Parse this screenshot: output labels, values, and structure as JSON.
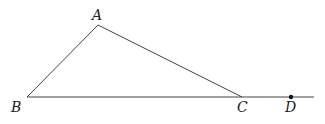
{
  "diagram": {
    "type": "geometry-triangle",
    "points": {
      "A": {
        "label": "A",
        "x": 98,
        "y": 25
      },
      "B": {
        "label": "B",
        "x": 27,
        "y": 97
      },
      "C": {
        "label": "C",
        "x": 242,
        "y": 97
      },
      "D": {
        "label": "D",
        "x": 291,
        "y": 97
      }
    },
    "segments": [
      [
        "A",
        "B"
      ],
      [
        "A",
        "C"
      ],
      [
        "B",
        "C"
      ]
    ],
    "extension": {
      "from": "C",
      "to_x": 314,
      "y": 97
    },
    "dots": [
      "D"
    ],
    "line_color": "#444444"
  }
}
